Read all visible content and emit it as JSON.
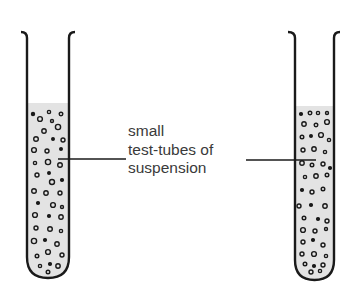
{
  "diagram": {
    "label_lines": [
      "small",
      "test-tubes of",
      "suspension"
    ],
    "colors": {
      "stroke": "#1a1a1a",
      "liquid": "#e3e3e3",
      "text": "#3a3a3a",
      "background": "#ffffff"
    },
    "tubes": [
      {
        "name": "left-test-tube",
        "x_left": 26,
        "x_right": 70,
        "top": 32,
        "liquid_top": 103,
        "bottom": 279
      },
      {
        "name": "right-test-tube",
        "x_left": 294,
        "x_right": 335,
        "top": 32,
        "liquid_top": 106,
        "bottom": 280
      }
    ]
  }
}
